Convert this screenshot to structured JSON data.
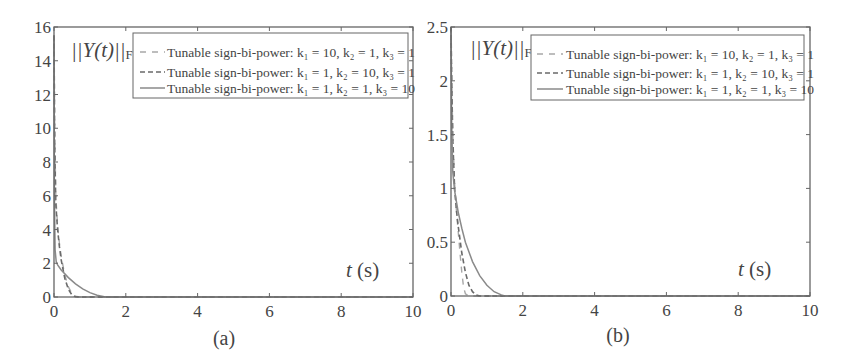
{
  "figures": [
    {
      "id": "a",
      "caption": "(a)",
      "ylabel_main": "||Y(t)||",
      "ylabel_sub": "F",
      "xlabel_italic": "t",
      "xlabel_unit": " (s)",
      "xticks": [
        "0",
        "2",
        "4",
        "6",
        "8",
        "10"
      ],
      "yticks": [
        "0",
        "2",
        "4",
        "6",
        "8",
        "10",
        "12",
        "14",
        "16"
      ],
      "legend": [
        "Tunable sign-bi-power: k₁ = 10, k₂ = 1, k₃ = 1",
        "Tunable sign-bi-power: k₁ = 1, k₂ = 10, k₃ = 1",
        "Tunable sign-bi-power: k₁ = 1, k₂ = 1, k₃ = 10"
      ]
    },
    {
      "id": "b",
      "caption": "(b)",
      "ylabel_main": "||Y(t)||",
      "ylabel_sub": "F",
      "xlabel_italic": "t",
      "xlabel_unit": " (s)",
      "xticks": [
        "0",
        "2",
        "4",
        "6",
        "8",
        "10"
      ],
      "yticks": [
        "0",
        "0.5",
        "1",
        "1.5",
        "2",
        "2.5"
      ],
      "legend": [
        "Tunable sign-bi-power: k₁ = 10, k₂ = 1, k₃ = 1",
        "Tunable sign-bi-power: k₁ = 1, k₂ = 10, k₃ = 1",
        "Tunable sign-bi-power: k₁ = 1, k₂ = 1, k₃ = 10"
      ]
    }
  ],
  "colors": {
    "axis": "#555555",
    "series_1": "#a8a8a8",
    "series_2": "#7a7a7a",
    "series_3": "#8a8a8a"
  },
  "chart_data": [
    {
      "type": "line",
      "title": "(a)",
      "xlabel": "t (s)",
      "ylabel": "||Y(t)||_F",
      "xlim": [
        0,
        10
      ],
      "ylim": [
        0,
        16
      ],
      "xticks": [
        0,
        2,
        4,
        6,
        8,
        10
      ],
      "yticks": [
        0,
        2,
        4,
        6,
        8,
        10,
        12,
        14,
        16
      ],
      "grid": false,
      "legend_position": "upper right",
      "series": [
        {
          "name": "Tunable sign-bi-power: k1 = 10, k2 = 1, k3 = 1",
          "style": "dashed-light",
          "x": [
            0,
            0.02,
            0.05,
            0.1,
            0.15,
            0.2,
            0.3,
            0.4,
            0.5,
            0.6,
            0.7,
            1.0,
            10
          ],
          "y": [
            15.5,
            10,
            6,
            4.2,
            3.2,
            2.4,
            1.3,
            0.6,
            0.2,
            0.05,
            0,
            0,
            0
          ]
        },
        {
          "name": "Tunable sign-bi-power: k1 = 1, k2 = 10, k3 = 1",
          "style": "dashed-dark",
          "x": [
            0,
            0.02,
            0.05,
            0.1,
            0.15,
            0.2,
            0.3,
            0.4,
            0.5,
            0.6,
            0.7,
            1.0,
            10
          ],
          "y": [
            15.5,
            9,
            5.5,
            4.0,
            3.0,
            2.2,
            1.1,
            0.45,
            0.12,
            0.02,
            0,
            0,
            0
          ]
        },
        {
          "name": "Tunable sign-bi-power: k1 = 1, k2 = 1, k3 = 10",
          "style": "solid",
          "x": [
            0,
            0.01,
            0.03,
            0.06,
            0.1,
            0.2,
            0.4,
            0.6,
            0.8,
            1.0,
            1.2,
            1.4,
            1.5,
            10
          ],
          "y": [
            15.5,
            6,
            2.8,
            2.1,
            1.9,
            1.6,
            1.15,
            0.78,
            0.48,
            0.26,
            0.1,
            0.02,
            0,
            0
          ]
        }
      ]
    },
    {
      "type": "line",
      "title": "(b)",
      "xlabel": "t (s)",
      "ylabel": "||Y(t)||_F",
      "xlim": [
        0,
        10
      ],
      "ylim": [
        0,
        2.5
      ],
      "xticks": [
        0,
        2,
        4,
        6,
        8,
        10
      ],
      "yticks": [
        0,
        0.5,
        1,
        1.5,
        2,
        2.5
      ],
      "grid": false,
      "legend_position": "upper right",
      "series": [
        {
          "name": "Tunable sign-bi-power: k1 = 10, k2 = 1, k3 = 1",
          "style": "dashed-light",
          "x": [
            0,
            0.02,
            0.05,
            0.1,
            0.15,
            0.2,
            0.25,
            0.3,
            0.35,
            0.4,
            0.5,
            1.0,
            10
          ],
          "y": [
            2.5,
            2.0,
            1.5,
            1.05,
            0.8,
            0.6,
            0.4,
            0.22,
            0.08,
            0.02,
            0,
            0,
            0
          ]
        },
        {
          "name": "Tunable sign-bi-power: k1 = 1, k2 = 10, k3 = 1",
          "style": "dashed-dark",
          "x": [
            0,
            0.02,
            0.05,
            0.1,
            0.15,
            0.2,
            0.3,
            0.4,
            0.5,
            0.6,
            0.7,
            0.8,
            10
          ],
          "y": [
            2.5,
            2.0,
            1.45,
            1.0,
            0.8,
            0.65,
            0.4,
            0.22,
            0.1,
            0.04,
            0.01,
            0,
            0
          ]
        },
        {
          "name": "Tunable sign-bi-power: k1 = 1, k2 = 1, k3 = 10",
          "style": "solid",
          "x": [
            0,
            0.02,
            0.05,
            0.1,
            0.2,
            0.3,
            0.4,
            0.6,
            0.8,
            1.0,
            1.2,
            1.4,
            1.5,
            10
          ],
          "y": [
            2.5,
            1.6,
            1.15,
            0.98,
            0.78,
            0.63,
            0.5,
            0.32,
            0.19,
            0.1,
            0.04,
            0.01,
            0,
            0
          ]
        }
      ]
    }
  ]
}
